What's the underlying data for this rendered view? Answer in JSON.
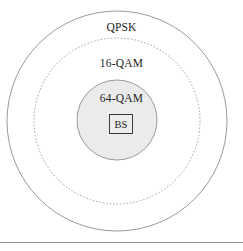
{
  "figure": {
    "type": "concentric-coverage-diagram",
    "width": 243,
    "height": 251,
    "background_color": "#ffffff",
    "stroke_color": "#8e8e8e",
    "inner_fill_color": "#ebebeb",
    "text_color": "#1c1c1c"
  },
  "rings": [
    {
      "id": "outer",
      "label": "QPSK",
      "center_x": 117,
      "center_y": 121,
      "radius": 110,
      "stroke_style": "solid",
      "fill": "#ffffff"
    },
    {
      "id": "middle",
      "label": "16-QAM",
      "center_x": 117,
      "center_y": 121,
      "radius": 83,
      "stroke_style": "dashed",
      "fill": "none"
    },
    {
      "id": "inner",
      "label": "64-QAM",
      "center_x": 117,
      "center_y": 120,
      "radius": 40,
      "stroke_style": "solid",
      "fill": "#ebebeb"
    }
  ],
  "center_node": {
    "label": "BS",
    "shape": "square",
    "border_color": "#3a3a3a",
    "fill": "#ededed"
  },
  "footer": {
    "rule_color": "#8e8e8e"
  }
}
